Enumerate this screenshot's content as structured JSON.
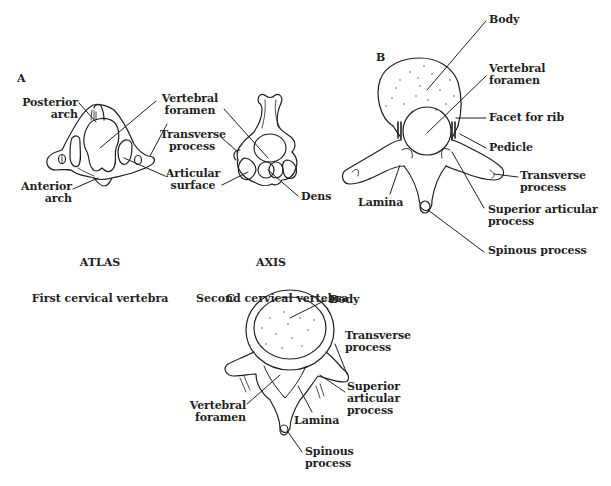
{
  "figure": {
    "panels": [
      {
        "id": "A",
        "letter": "A",
        "parts": [
          {
            "title": "ATLAS",
            "subtitle": "First cervical vertebra",
            "labels": {
              "posterior_arch": "Posterior\narch",
              "anterior_arch": "Anterior\narch"
            }
          },
          {
            "title": "AXIS",
            "subtitle": "Second cervical vertebra",
            "labels": {
              "dens": "Dens"
            }
          }
        ],
        "shared_labels": {
          "vertebral_foramen": "Vertebral\nforamen",
          "transverse_process": "Transverse\nprocess",
          "articular_surface": "Articular\nsurface"
        }
      },
      {
        "id": "B",
        "letter": "B",
        "labels": {
          "body": "Body",
          "vertebral_foramen": "Vertebral\nforamen",
          "facet_for_rib": "Facet for rib",
          "pedicle": "Pedicle",
          "transverse_process": "Transverse\nprocess",
          "superior_articular_process": "Superior articular\nprocess",
          "lamina": "Lamina",
          "spinous_process": "Spinous process"
        }
      },
      {
        "id": "C",
        "letter": "C",
        "labels": {
          "body": "Body",
          "transverse_process": "Transverse\nprocess",
          "superior_articular_process": "Superior\narticular\nprocess",
          "vertebral_foramen": "Vertebral\nforamen",
          "lamina": "Lamina",
          "spinous_process": "Spinous\nprocess"
        }
      }
    ]
  }
}
